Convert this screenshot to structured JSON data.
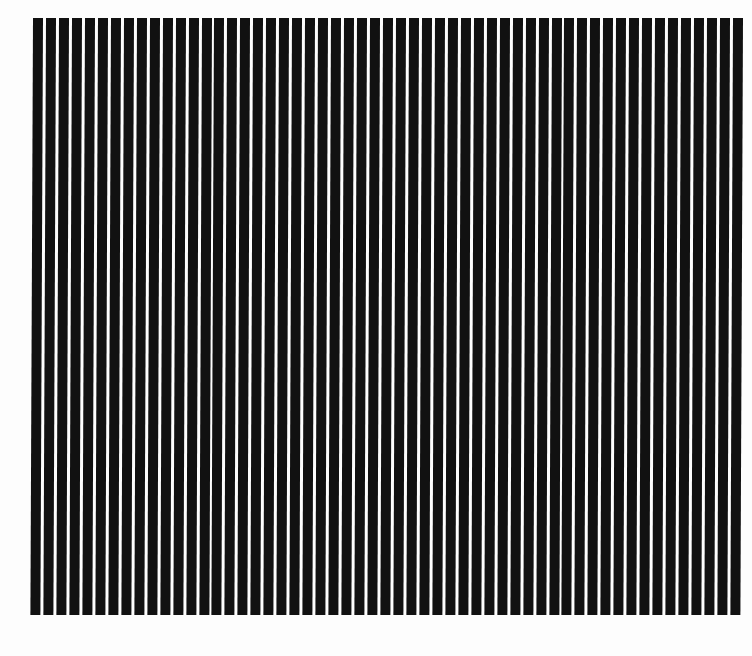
{
  "image": {
    "description": "Vertical black-and-white stripe grating pattern",
    "background_color": "#fdfdfd",
    "bar_color": "#111111",
    "gap_color": "#fdfdfd",
    "bar_count": 55,
    "bar_width_px": 10,
    "period_px": 12.9,
    "region": {
      "left": 33,
      "top": 18,
      "width": 710,
      "height": 597
    }
  }
}
